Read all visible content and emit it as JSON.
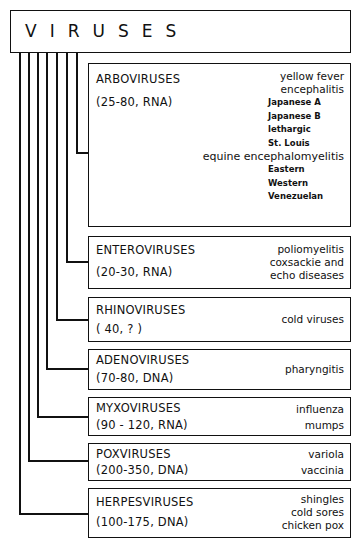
{
  "title": "VIRUSES",
  "colors": {
    "ink": "#111111",
    "background": "#ffffff"
  },
  "groups": [
    {
      "name": "ARBOVIRUSES",
      "size": "(25-80, RNA)",
      "diseases": {
        "yellow_fever": "yellow fever",
        "encephalitis": "encephalitis",
        "encephalitis_types": [
          "Japanese A",
          "Japanese B",
          "lethargic",
          "St. Louis"
        ],
        "equine": "equine encephalomyelitis",
        "equine_types": [
          "Eastern",
          "Western",
          "Venezuelan"
        ]
      }
    },
    {
      "name": "ENTEROVIRUSES",
      "size": "(20-30, RNA)",
      "diseases": [
        "poliomyelitis",
        "coxsackie and",
        "echo diseases"
      ]
    },
    {
      "name": "RHINOVIRUSES",
      "size": "( 40,  ? )",
      "diseases": [
        "cold viruses"
      ]
    },
    {
      "name": "ADENOVIRUSES",
      "size": "(70-80, DNA)",
      "diseases": [
        "pharyngitis"
      ]
    },
    {
      "name": "MYXOVIRUSES",
      "size": "(90 - 120, RNA)",
      "diseases": [
        "influenza",
        "mumps"
      ]
    },
    {
      "name": "POXVIRUSES",
      "size": "(200-350, DNA)",
      "diseases": [
        "variola",
        "vaccinia"
      ]
    },
    {
      "name": "HERPESVIRUSES",
      "size": "(100-175, DNA)",
      "diseases": [
        "shingles",
        "cold sores",
        "chicken pox"
      ]
    }
  ]
}
